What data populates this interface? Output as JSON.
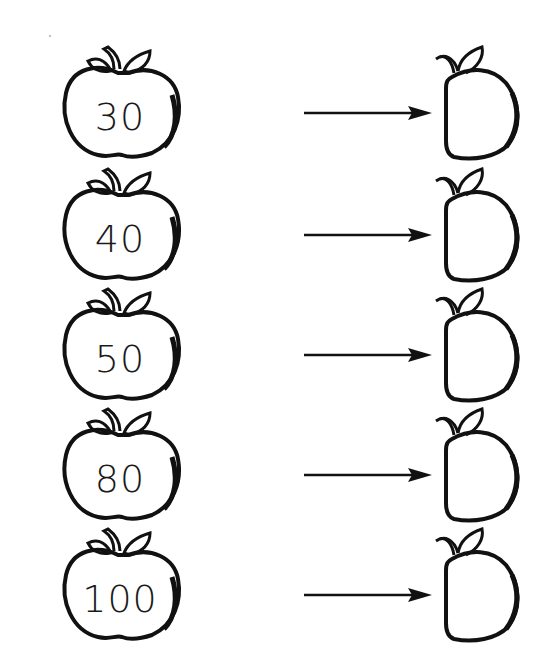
{
  "worksheet": {
    "rows": [
      {
        "number": "30"
      },
      {
        "number": "40"
      },
      {
        "number": "50"
      },
      {
        "number": "80"
      },
      {
        "number": "100"
      }
    ],
    "colors": {
      "ink": "#111111",
      "paper": "#ffffff"
    },
    "icons": {
      "left": "apple-outline-icon",
      "middle": "arrow-right-icon",
      "right": "half-apple-outline-icon"
    }
  }
}
